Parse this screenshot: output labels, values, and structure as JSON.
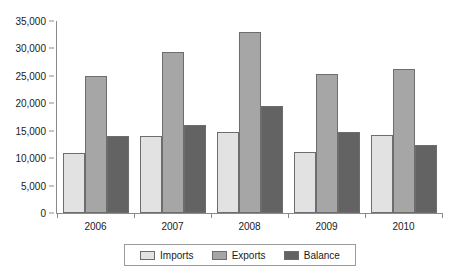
{
  "chart_data": {
    "type": "bar",
    "title": "",
    "subtitle": "",
    "xlabel": "",
    "ylabel": "",
    "categories": [
      "2006",
      "2007",
      "2008",
      "2009",
      "2010"
    ],
    "series": [
      {
        "name": "Imports",
        "color": "#e2e2e2",
        "values": [
          11000,
          14000,
          14700,
          11100,
          14200
        ]
      },
      {
        "name": "Exports",
        "color": "#a6a6a6",
        "values": [
          25000,
          29400,
          33000,
          25300,
          26200
        ]
      },
      {
        "name": "Balance",
        "color": "#636363",
        "values": [
          14000,
          16000,
          19500,
          14800,
          12400
        ]
      }
    ],
    "ylim": [
      0,
      35000
    ],
    "ytick_values": [
      0,
      5000,
      10000,
      15000,
      20000,
      25000,
      30000,
      35000
    ],
    "ytick_labels": [
      "0",
      "5,000",
      "10,000",
      "15,000",
      "20,000",
      "25,000",
      "30,000",
      "35,000"
    ],
    "grid": false,
    "legend_position": "bottom",
    "legend_entries": [
      "Imports",
      "Exports",
      "Balance"
    ]
  }
}
